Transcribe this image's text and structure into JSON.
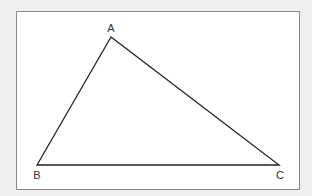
{
  "diagram": {
    "type": "triangle",
    "colors": {
      "page_background": "#efefef",
      "frame_background": "#ffffff",
      "frame_border": "#8a8a8a",
      "line": "#222222",
      "label": "#333333"
    },
    "vertices": [
      {
        "id": "A",
        "label": "A",
        "x": 111,
        "y": 37
      },
      {
        "id": "B",
        "label": "B",
        "x": 37,
        "y": 165
      },
      {
        "id": "C",
        "label": "C",
        "x": 279,
        "y": 165
      }
    ],
    "edges": [
      {
        "from": "A",
        "to": "B"
      },
      {
        "from": "B",
        "to": "C"
      },
      {
        "from": "C",
        "to": "A"
      }
    ]
  }
}
